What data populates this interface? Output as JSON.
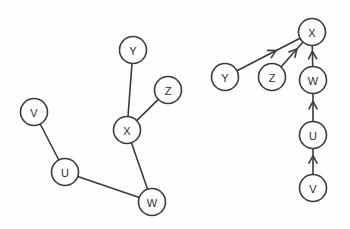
{
  "figure": {
    "background_color": "#fefefe",
    "stroke_color": "#3a3a3a",
    "node_fill_color": "#ffffff",
    "label_color": "#2b2b2b",
    "node_radius": 13.5,
    "width": 350,
    "height": 229
  },
  "graphs": [
    {
      "id": "left-graph",
      "name": "undirected-graph",
      "directed": false,
      "nodes": [
        {
          "id": "V",
          "label": "V",
          "x": 34,
          "y": 112
        },
        {
          "id": "U",
          "label": "U",
          "x": 65,
          "y": 172
        },
        {
          "id": "W",
          "label": "W",
          "x": 152,
          "y": 202
        },
        {
          "id": "X",
          "label": "X",
          "x": 127,
          "y": 130
        },
        {
          "id": "Y",
          "label": "Y",
          "x": 133,
          "y": 50
        },
        {
          "id": "Z",
          "label": "Z",
          "x": 168,
          "y": 90
        }
      ],
      "edges": [
        {
          "from": "V",
          "to": "U"
        },
        {
          "from": "U",
          "to": "W"
        },
        {
          "from": "W",
          "to": "X"
        },
        {
          "from": "X",
          "to": "Y"
        },
        {
          "from": "X",
          "to": "Z"
        }
      ]
    },
    {
      "id": "right-graph",
      "name": "directed-graph",
      "directed": true,
      "nodes": [
        {
          "id": "X",
          "label": "X",
          "x": 312,
          "y": 32
        },
        {
          "id": "Y",
          "label": "Y",
          "x": 225,
          "y": 77
        },
        {
          "id": "Z",
          "label": "Z",
          "x": 272,
          "y": 77
        },
        {
          "id": "W",
          "label": "W",
          "x": 313,
          "y": 80
        },
        {
          "id": "U",
          "label": "U",
          "x": 313,
          "y": 135
        },
        {
          "id": "V",
          "label": "V",
          "x": 313,
          "y": 188
        }
      ],
      "edges": [
        {
          "from": "Y",
          "to": "X"
        },
        {
          "from": "Z",
          "to": "X"
        },
        {
          "from": "W",
          "to": "X"
        },
        {
          "from": "U",
          "to": "W"
        },
        {
          "from": "V",
          "to": "U"
        }
      ]
    }
  ]
}
